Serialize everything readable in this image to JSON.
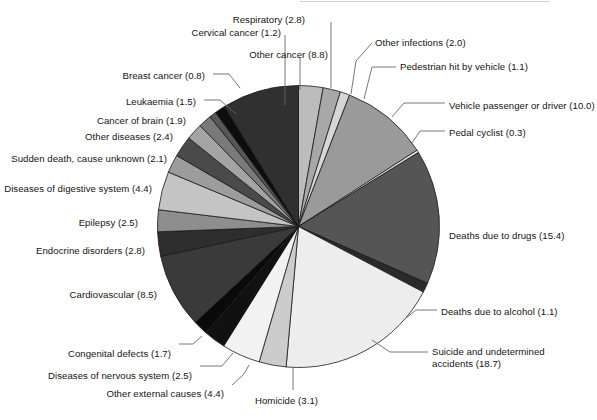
{
  "figure": {
    "type": "pie",
    "background": "#ffffff",
    "text_color": "#141414",
    "outline_color": "#1a1a1a",
    "leader_color": "#555555"
  },
  "chart_data": {
    "type": "pie",
    "title": "",
    "subtitle": "",
    "xlabel": "",
    "ylabel": "",
    "legend": "none",
    "grid": false,
    "value_units": "percent",
    "start_angle_deg": 0,
    "direction": "clockwise",
    "total": 100.2,
    "labels": [
      "Respiratory (2.8)",
      "Other infections (2.0)",
      "Pedestrian hit by vehicle (1.1)",
      "Vehicle passenger or driver (10.0)",
      "Pedal cyclist (0.3)",
      "Deaths due to drugs (15.4)",
      "Deaths due to alcohol (1.1)",
      "Suicide and undetermined accidents (18.7)",
      "Homicide (3.1)",
      "Other external causes (4.4)",
      "Diseases of nervous system (2.5)",
      "Congenital defects (1.7)",
      "Cardiovascular (8.5)",
      "Endocrine disorders (2.8)",
      "Epilepsy (2.5)",
      "Diseases of digestive system (4.4)",
      "Sudden death, cause unknown (2.1)",
      "Other diseases (2.4)",
      "Cancer of brain (1.9)",
      "Leukaemia (1.5)",
      "Breast cancer (0.8)",
      "Cervical cancer (1.2)",
      "Other cancer (8.8)"
    ],
    "categories": [
      "Respiratory",
      "Other infections",
      "Pedestrian hit by vehicle",
      "Vehicle passenger or driver",
      "Pedal cyclist",
      "Deaths due to drugs",
      "Deaths due to alcohol",
      "Suicide and undetermined accidents",
      "Homicide",
      "Other external causes",
      "Diseases of nervous system",
      "Congenital defects",
      "Cardiovascular",
      "Endocrine disorders",
      "Epilepsy",
      "Diseases of digestive system",
      "Sudden death, cause unknown",
      "Other diseases",
      "Cancer of brain",
      "Leukaemia",
      "Breast cancer",
      "Cervical cancer",
      "Other cancer"
    ],
    "values": [
      2.8,
      2.0,
      1.1,
      10.0,
      0.3,
      15.4,
      1.1,
      18.7,
      3.1,
      4.4,
      2.5,
      1.7,
      8.5,
      2.8,
      2.5,
      4.4,
      2.1,
      2.4,
      1.9,
      1.5,
      0.8,
      1.2,
      8.8
    ],
    "colors": [
      "#bcbcbc",
      "#a8a8a8",
      "#d6d6d6",
      "#9a9a9a",
      "#e8e8e8",
      "#555555",
      "#2a2a2a",
      "#ededed",
      "#cccccc",
      "#f2f2f2",
      "#111111",
      "#0a0a0a",
      "#3a3a3a",
      "#2e2e2e",
      "#8e8e8e",
      "#c4c4c4",
      "#9c9c9c",
      "#4a4a4a",
      "#a4a4a4",
      "#7a7a7a",
      "#575757",
      "#0d0d0d",
      "#303030"
    ]
  },
  "labels": {
    "respiratory": {
      "text": "Respiratory (2.8)",
      "x": 305,
      "y": 14,
      "align": "l"
    },
    "other_infections": {
      "text": "Other infections (2.0)",
      "x": 375,
      "y": 37,
      "align": "r"
    },
    "pedestrian": {
      "text": "Pedestrian hit by vehicle (1.1)",
      "x": 400,
      "y": 61,
      "align": "r"
    },
    "vehicle_passenger": {
      "text": "Vehicle passenger or driver (10.0)",
      "x": 449,
      "y": 100,
      "align": "r"
    },
    "pedal_cyclist": {
      "text": "Pedal cyclist (0.3)",
      "x": 449,
      "y": 127,
      "align": "r"
    },
    "drugs": {
      "text": "Deaths due to drugs (15.4)",
      "x": 449,
      "y": 230,
      "align": "r"
    },
    "alcohol": {
      "text": "Deaths due to alcohol (1.1)",
      "x": 441,
      "y": 306,
      "align": "r"
    },
    "suicide_l1": {
      "text": "Suicide and undetermined",
      "x": 432,
      "y": 346,
      "align": "r"
    },
    "suicide_l2": {
      "text": "accidents (18.7)",
      "x": 432,
      "y": 358,
      "align": "r"
    },
    "homicide": {
      "text": "Homicide (3.1)",
      "x": 255,
      "y": 395,
      "align": "r"
    },
    "other_external": {
      "text": "Other external causes (4.4)",
      "x": 224,
      "y": 388,
      "align": "l"
    },
    "nervous_system": {
      "text": "Diseases of nervous system (2.5)",
      "x": 192,
      "y": 370,
      "align": "l"
    },
    "congenital": {
      "text": "Congenital defects (1.7)",
      "x": 171,
      "y": 348,
      "align": "l"
    },
    "cardiovascular": {
      "text": "Cardiovascular (8.5)",
      "x": 157,
      "y": 289,
      "align": "l"
    },
    "endocrine": {
      "text": "Endocrine disorders (2.8)",
      "x": 145,
      "y": 245,
      "align": "l"
    },
    "epilepsy": {
      "text": "Epilepsy (2.5)",
      "x": 138,
      "y": 217,
      "align": "l"
    },
    "digestive": {
      "text": "Diseases of digestive system (4.4)",
      "x": 152,
      "y": 183,
      "align": "l"
    },
    "sudden_death": {
      "text": "Sudden death, cause unknown (2.1)",
      "x": 167,
      "y": 153,
      "align": "l"
    },
    "other_diseases": {
      "text": "Other diseases (2.4)",
      "x": 173,
      "y": 131,
      "align": "l"
    },
    "brain_cancer": {
      "text": "Cancer of brain (1.9)",
      "x": 186,
      "y": 115,
      "align": "l"
    },
    "leukaemia": {
      "text": "Leukaemia (1.5)",
      "x": 196,
      "y": 96,
      "align": "l"
    },
    "breast_cancer": {
      "text": "Breast cancer (0.8)",
      "x": 205,
      "y": 70,
      "align": "l"
    },
    "cervical_cancer": {
      "text": "Cervical cancer (1.2)",
      "x": 281,
      "y": 27,
      "align": "l"
    },
    "other_cancer": {
      "text": "Other cancer (8.8)",
      "x": 328,
      "y": 49,
      "align": "l"
    }
  }
}
